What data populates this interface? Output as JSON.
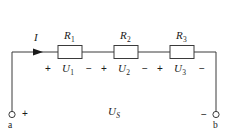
{
  "figure": {
    "name": "series-resistor-circuit",
    "colors": {
      "wire": "#3a3a3a",
      "text": "#1a1a1a",
      "background": "#ffffff",
      "resistor_fill": "#ffffff"
    }
  },
  "current": {
    "symbol": "I",
    "arrow": "current-arrow-right"
  },
  "resistors": [
    {
      "symbol": "R",
      "subscript": "1",
      "name": "resistor-r1"
    },
    {
      "symbol": "R",
      "subscript": "2",
      "name": "resistor-r2"
    },
    {
      "symbol": "R",
      "subscript": "3",
      "name": "resistor-r3"
    }
  ],
  "voltages": [
    {
      "symbol": "U",
      "subscript": "1",
      "plus": "+",
      "minus": "−"
    },
    {
      "symbol": "U",
      "subscript": "2",
      "plus": "+",
      "minus": "−"
    },
    {
      "symbol": "U",
      "subscript": "3",
      "plus": "+",
      "minus": "−"
    }
  ],
  "source": {
    "symbol": "U",
    "subscript": "S"
  },
  "terminals": [
    {
      "label": "a",
      "polarity": "+",
      "name": "terminal-a"
    },
    {
      "label": "b",
      "polarity": "−",
      "name": "terminal-b"
    }
  ]
}
